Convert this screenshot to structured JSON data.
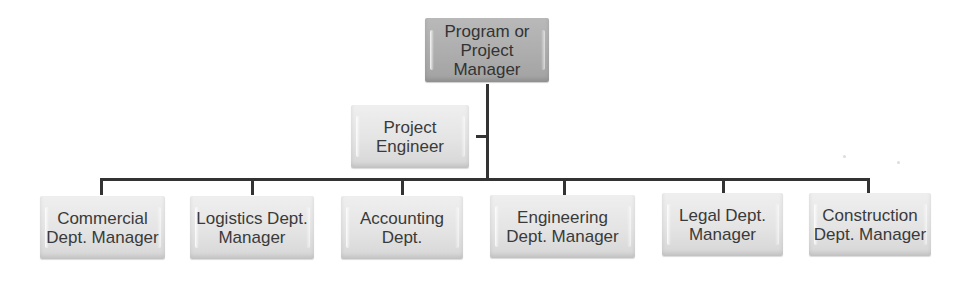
{
  "diagram": {
    "type": "org-chart",
    "root": {
      "label": "Program or\nProject\nManager"
    },
    "staff": {
      "label": "Project\nEngineer"
    },
    "departments": [
      {
        "label": "Commercial\nDept. Manager"
      },
      {
        "label": "Logistics Dept.\nManager"
      },
      {
        "label": "Accounting\nDept."
      },
      {
        "label": "Engineering\nDept. Manager"
      },
      {
        "label": "Legal Dept.\nManager"
      },
      {
        "label": "Construction\nDept. Manager"
      }
    ],
    "colors": {
      "root_fill": "#adadad",
      "node_fill": "#e4e4e4",
      "connector": "#333333",
      "text": "#3a3a3a"
    }
  }
}
